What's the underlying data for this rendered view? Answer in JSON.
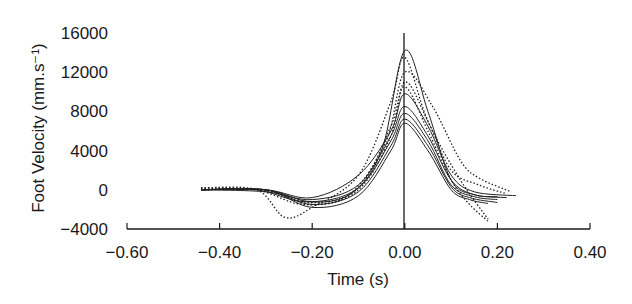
{
  "chart_data": {
    "type": "line",
    "title": "",
    "xlabel": "Time (s)",
    "ylabel": "Foot Velocity (mm.s⁻¹)",
    "xlim": [
      -0.6,
      0.4
    ],
    "ylim": [
      -4000,
      16000
    ],
    "x_ticks": [
      "−0.60",
      "−0.40",
      "−0.20",
      "0.00",
      "0.20",
      "0.40"
    ],
    "x_tick_values": [
      -0.6,
      -0.4,
      -0.2,
      0.0,
      0.2,
      0.4
    ],
    "y_ticks": [
      "16000",
      "12000",
      "8000",
      "4000",
      "0",
      "−4000"
    ],
    "y_tick_values": [
      16000,
      12000,
      8000,
      4000,
      0,
      -4000
    ],
    "grid": false,
    "legend": null,
    "annotations": [
      "vertical reference line at t = 0.00 s"
    ],
    "line_styles": "solid and dotted traces (multiple trials)",
    "series": [
      {
        "name": "trial-1 (solid)",
        "style": "solid",
        "x": [
          -0.44,
          -0.32,
          -0.22,
          -0.12,
          -0.05,
          0.0,
          0.05,
          0.1,
          0.15,
          0.2
        ],
        "y": [
          0,
          0,
          -1200,
          -500,
          4000,
          14200,
          8000,
          1000,
          -500,
          -700
        ]
      },
      {
        "name": "trial-2 (dotted)",
        "style": "dotted",
        "x": [
          -0.44,
          -0.32,
          -0.26,
          -0.2,
          -0.1,
          -0.03,
          0.0,
          0.05,
          0.12,
          0.18
        ],
        "y": [
          200,
          0,
          -2800,
          -1800,
          1500,
          9000,
          13500,
          7000,
          1000,
          -3000
        ]
      },
      {
        "name": "trial-3 (dotted)",
        "style": "dotted",
        "x": [
          -0.44,
          -0.32,
          -0.22,
          -0.12,
          -0.04,
          0.0,
          0.06,
          0.12,
          0.16,
          0.23
        ],
        "y": [
          200,
          0,
          -1500,
          -500,
          5000,
          12000,
          8500,
          3000,
          1200,
          -200
        ]
      },
      {
        "name": "trial-4 (dotted)",
        "style": "dotted",
        "x": [
          -0.44,
          -0.3,
          -0.2,
          -0.1,
          -0.03,
          0.0,
          0.05,
          0.1,
          0.16,
          0.22
        ],
        "y": [
          0,
          -100,
          -1500,
          0,
          5500,
          11000,
          7000,
          2000,
          500,
          -400
        ]
      },
      {
        "name": "trial-5 (solid)",
        "style": "solid",
        "x": [
          -0.44,
          -0.3,
          -0.2,
          -0.1,
          -0.03,
          0.0,
          0.05,
          0.1,
          0.15,
          0.24
        ],
        "y": [
          0,
          0,
          -800,
          1500,
          6000,
          9800,
          6500,
          1500,
          -200,
          -600
        ]
      },
      {
        "name": "trial-6 (solid)",
        "style": "solid",
        "x": [
          -0.44,
          -0.3,
          -0.2,
          -0.1,
          -0.03,
          0.0,
          0.05,
          0.1,
          0.15,
          0.22
        ],
        "y": [
          0,
          -200,
          -1000,
          500,
          5500,
          8500,
          5500,
          1000,
          -500,
          -800
        ]
      },
      {
        "name": "trial-7 (solid)",
        "style": "solid",
        "x": [
          -0.44,
          -0.3,
          -0.2,
          -0.1,
          -0.03,
          0.0,
          0.05,
          0.1,
          0.15,
          0.2
        ],
        "y": [
          0,
          0,
          -1200,
          200,
          5000,
          7800,
          5000,
          500,
          -700,
          -1000
        ]
      },
      {
        "name": "trial-8 (solid)",
        "style": "solid",
        "x": [
          -0.44,
          -0.3,
          -0.2,
          -0.1,
          -0.03,
          0.0,
          0.05,
          0.1,
          0.14,
          0.2
        ],
        "y": [
          0,
          0,
          -1500,
          -200,
          4500,
          7200,
          4500,
          300,
          -800,
          -1300
        ]
      },
      {
        "name": "trial-9 (solid)",
        "style": "solid",
        "x": [
          -0.44,
          -0.3,
          -0.2,
          -0.1,
          -0.03,
          0.0,
          0.05,
          0.1,
          0.14,
          0.18
        ],
        "y": [
          0,
          0,
          -1800,
          -600,
          4000,
          6800,
          4000,
          0,
          -1000,
          -1400
        ]
      },
      {
        "name": "trial-10 (dotted)",
        "style": "dotted",
        "x": [
          -0.44,
          -0.3,
          -0.2,
          -0.1,
          -0.03,
          0.0,
          0.05,
          0.1,
          0.14,
          0.18
        ],
        "y": [
          100,
          0,
          -1300,
          200,
          6500,
          10500,
          6000,
          1000,
          -1500,
          -3200
        ]
      }
    ]
  }
}
